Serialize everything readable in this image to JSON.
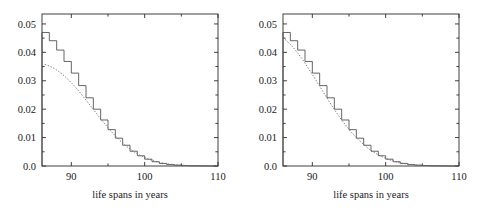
{
  "figure": {
    "panels": [
      {
        "id": "left",
        "name": "panel-left",
        "xlabel": "life spans in years",
        "ylabel": "",
        "xticklabels": [
          "90",
          "100",
          "110"
        ],
        "xtickvalues": [
          90,
          100,
          110
        ],
        "xminorticks": [
          95,
          105
        ],
        "yticklabels": [
          "0.0",
          "0.01",
          "0.02",
          "0.03",
          "0.04",
          "0.05"
        ],
        "ytickvalues": [
          0.0,
          0.01,
          0.02,
          0.03,
          0.04,
          0.05
        ]
      },
      {
        "id": "right",
        "name": "panel-right",
        "xlabel": "life spans in years",
        "ylabel": "",
        "xticklabels": [
          "90",
          "100",
          "110"
        ],
        "xtickvalues": [
          90,
          100,
          110
        ],
        "xminorticks": [
          95,
          105
        ],
        "yticklabels": [
          "0.0",
          "0.01",
          "0.02",
          "0.03",
          "0.04",
          "0.05"
        ],
        "ytickvalues": [
          0.0,
          0.01,
          0.02,
          0.03,
          0.04,
          0.05
        ]
      }
    ]
  },
  "chart_data": [
    {
      "type": "line",
      "title": "",
      "xlabel": "life spans in years",
      "ylabel": "",
      "xlim": [
        86,
        110
      ],
      "ylim": [
        0,
        0.0535
      ],
      "grid": false,
      "legend": "none",
      "series": [
        {
          "name": "empirical-step-density",
          "style": "step",
          "color": "#4a4a4a",
          "x": [
            86,
            87,
            88,
            89,
            90,
            91,
            92,
            93,
            94,
            95,
            96,
            97,
            98,
            99,
            100,
            101,
            102,
            103,
            104,
            105,
            106,
            107,
            108,
            109,
            110
          ],
          "values": [
            0.047,
            0.0441,
            0.0408,
            0.0368,
            0.0327,
            0.0283,
            0.024,
            0.02,
            0.0162,
            0.0128,
            0.0098,
            0.0073,
            0.0052,
            0.0036,
            0.0024,
            0.0015,
            0.0009,
            0.0005,
            0.0003,
            0.00015,
            8e-05,
            4e-05,
            2e-05,
            1e-05,
            0.0
          ]
        },
        {
          "name": "fitted-model-curve",
          "style": "dotted",
          "color": "#6e6e6e",
          "x": [
            86,
            87,
            88,
            89,
            90,
            91,
            92,
            93,
            94,
            95,
            96,
            97,
            98,
            99,
            100,
            101,
            102,
            103,
            104,
            105,
            106,
            107,
            108,
            109,
            110
          ],
          "values": [
            0.036,
            0.0352,
            0.0338,
            0.0318,
            0.0293,
            0.0264,
            0.0232,
            0.0199,
            0.0166,
            0.0135,
            0.0106,
            0.0081,
            0.006,
            0.0043,
            0.003,
            0.002,
            0.0013,
            0.0008,
            0.0005,
            0.0003,
            0.00015,
            8e-05,
            4e-05,
            2e-05,
            0.0
          ]
        }
      ]
    },
    {
      "type": "line",
      "title": "",
      "xlabel": "life spans in years",
      "ylabel": "",
      "xlim": [
        86,
        110
      ],
      "ylim": [
        0,
        0.0535
      ],
      "grid": false,
      "legend": "none",
      "series": [
        {
          "name": "empirical-step-density",
          "style": "step",
          "color": "#4a4a4a",
          "x": [
            86,
            87,
            88,
            89,
            90,
            91,
            92,
            93,
            94,
            95,
            96,
            97,
            98,
            99,
            100,
            101,
            102,
            103,
            104,
            105,
            106,
            107,
            108,
            109,
            110
          ],
          "values": [
            0.047,
            0.0441,
            0.0408,
            0.0368,
            0.0327,
            0.0283,
            0.024,
            0.02,
            0.0162,
            0.0128,
            0.0098,
            0.0073,
            0.0052,
            0.0036,
            0.0024,
            0.0015,
            0.0009,
            0.0005,
            0.0003,
            0.00015,
            8e-05,
            4e-05,
            2e-05,
            1e-05,
            0.0
          ]
        },
        {
          "name": "fitted-model-curve",
          "style": "dotted",
          "color": "#6e6e6e",
          "x": [
            86,
            87,
            88,
            89,
            90,
            91,
            92,
            93,
            94,
            95,
            96,
            97,
            98,
            99,
            100,
            101,
            102,
            103,
            104,
            105,
            106,
            107,
            108,
            109,
            110
          ],
          "values": [
            0.0452,
            0.0428,
            0.0398,
            0.0362,
            0.0322,
            0.0281,
            0.0239,
            0.0199,
            0.0162,
            0.0129,
            0.01,
            0.0076,
            0.0055,
            0.0039,
            0.0027,
            0.0018,
            0.0011,
            0.0007,
            0.0004,
            0.00022,
            0.00012,
            6e-05,
            3e-05,
            1e-05,
            0.0
          ]
        }
      ]
    }
  ]
}
